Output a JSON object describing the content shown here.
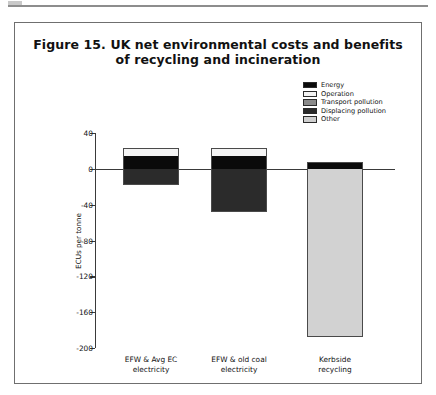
{
  "figure": {
    "title_line1": "Figure 15. UK net environmental costs and benefits",
    "title_line2": "of recycling and incineration"
  },
  "chart_data": {
    "type": "bar",
    "title": "Figure 15. UK net environmental costs and benefits of recycling and incineration",
    "subtype": "stacked-bar-with-negative",
    "xlabel": "",
    "ylabel": "ECUs per tonne",
    "ylim": [
      -200,
      40
    ],
    "yticks": [
      40,
      0,
      -40,
      -80,
      -120,
      -160,
      -200
    ],
    "ytick_labels": [
      "40",
      "0",
      "-40",
      "-80",
      "-120",
      "-160",
      "-200"
    ],
    "grid": false,
    "legend_position": "upper-right",
    "categories": [
      "EFW & Avg EC electricity",
      "EFW & old coal electricity",
      "Kerbside recycling"
    ],
    "category_lines": [
      [
        "EFW & Avg EC",
        "electricity"
      ],
      [
        "EFW & old coal",
        "electricity"
      ],
      [
        "Kerbside",
        "recycling"
      ]
    ],
    "series": [
      {
        "name": "Energy",
        "color": "#0a0a0a",
        "values": [
          14,
          14,
          8
        ]
      },
      {
        "name": "Operation",
        "color": "#f2f2f2",
        "values": [
          9,
          9,
          0
        ]
      },
      {
        "name": "Transport pollution",
        "color": "#8a8a8a",
        "values": [
          0,
          0,
          0
        ]
      },
      {
        "name": "Displacing pollution",
        "color": "#2b2b2b",
        "values": [
          -18,
          -48,
          0
        ]
      },
      {
        "name": "Other",
        "color": "#cfcfcf",
        "values": [
          0,
          0,
          -188
        ]
      }
    ],
    "bar_totals": [
      5,
      -25,
      -180
    ]
  },
  "legend": {
    "items": [
      {
        "label": "Energy",
        "swatch": "sw-energy"
      },
      {
        "label": "Operation",
        "swatch": "sw-operation"
      },
      {
        "label": "Transport pollution",
        "swatch": "sw-transport"
      },
      {
        "label": "Displacing pollution",
        "swatch": "sw-displacing"
      },
      {
        "label": "Other",
        "swatch": "sw-other"
      }
    ]
  }
}
